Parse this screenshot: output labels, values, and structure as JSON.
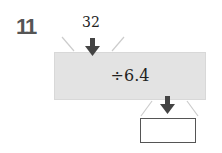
{
  "problem": {
    "number": "11",
    "input_value": "32",
    "operation": "÷6.4",
    "output_value": ""
  },
  "colors": {
    "box_fill": "#e3e3e3",
    "arrow": "#444444",
    "number_label": "#555555"
  },
  "icons": [
    "arrow-down-icon-input",
    "arrow-down-icon-output"
  ]
}
